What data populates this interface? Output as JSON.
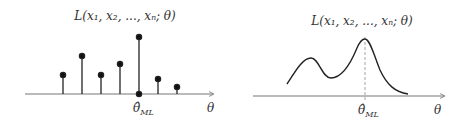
{
  "left_panel": {
    "title": "L(x₁, x₂, ..., xₙ; θ)",
    "x_axis_label": "θ",
    "estimator_label": "θ̂",
    "estimator_subscript": "ML",
    "type": "stem (discrete likelihood)"
  },
  "right_panel": {
    "title": "L(x₁, x₂, ..., xₙ; θ)",
    "x_axis_label": "θ",
    "estimator_label": "θ̂",
    "estimator_subscript": "ML",
    "type": "continuous bimodal likelihood curve with dashed line at maximum"
  },
  "colors": {
    "stroke": "#222222",
    "axis": "#555555",
    "dashed": "#999999"
  }
}
